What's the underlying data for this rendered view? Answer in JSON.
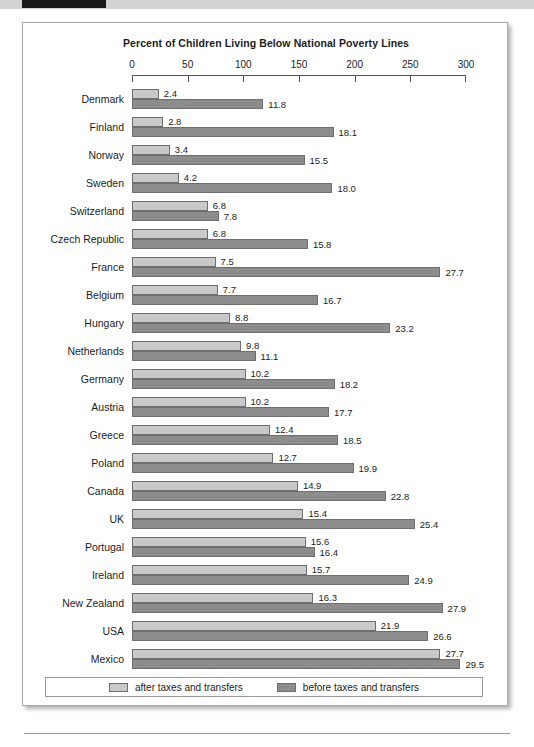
{
  "chart_data": {
    "type": "bar",
    "orientation": "horizontal",
    "title": "Percent of Children Living Below National Poverty Lines",
    "xlabel": "",
    "ylabel": "",
    "xlim": [
      0,
      300
    ],
    "xticks": [
      0,
      50,
      100,
      150,
      200,
      250,
      300
    ],
    "xtick_labels": [
      "0",
      "50",
      "100",
      "150",
      "200",
      "250",
      "300"
    ],
    "grid": false,
    "legend_position": "bottom",
    "categories": [
      "Denmark",
      "Finland",
      "Norway",
      "Sweden",
      "Switzerland",
      "Czech Republic",
      "France",
      "Belgium",
      "Hungary",
      "Netherlands",
      "Germany",
      "Austria",
      "Greece",
      "Poland",
      "Canada",
      "UK",
      "Portugal",
      "Ireland",
      "New Zealand",
      "USA",
      "Mexico"
    ],
    "series": [
      {
        "name": "after taxes and transfers",
        "color": "#c9c9c9",
        "values": [
          2.4,
          2.8,
          3.4,
          4.2,
          6.8,
          6.8,
          7.5,
          7.7,
          8.8,
          9.8,
          10.2,
          10.2,
          12.4,
          12.7,
          14.9,
          15.4,
          15.6,
          15.7,
          16.3,
          21.9,
          27.7
        ]
      },
      {
        "name": "before taxes and transfers",
        "color": "#8d8d8d",
        "values": [
          11.8,
          18.1,
          15.5,
          18.0,
          7.8,
          15.8,
          27.7,
          16.7,
          23.2,
          11.1,
          18.2,
          17.7,
          18.5,
          19.9,
          22.8,
          25.4,
          16.4,
          24.9,
          27.9,
          26.6,
          29.5
        ]
      }
    ],
    "value_labels": {
      "after": [
        "2.4",
        "2.8",
        "3.4",
        "4.2",
        "6.8",
        "6.8",
        "7.5",
        "7.7",
        "8.8",
        "9.8",
        "10.2",
        "10.2",
        "12.4",
        "12.7",
        "14.9",
        "15.4",
        "15.6",
        "15.7",
        "16.3",
        "21.9",
        "27.7"
      ],
      "before": [
        "11.8",
        "18.1",
        "15.5",
        "18.0",
        "7.8",
        "15.8",
        "27.7",
        "16.7",
        "23.2",
        "11.1",
        "18.2",
        "17.7",
        "18.5",
        "19.9",
        "22.8",
        "25.4",
        "16.4",
        "24.9",
        "27.9",
        "26.6",
        "29.5"
      ]
    },
    "bar_scale_factor": 10
  },
  "legend": {
    "items": [
      {
        "label": "after taxes and transfers",
        "color": "#c9c9c9"
      },
      {
        "label": "before taxes and transfers",
        "color": "#8d8d8d"
      }
    ]
  }
}
